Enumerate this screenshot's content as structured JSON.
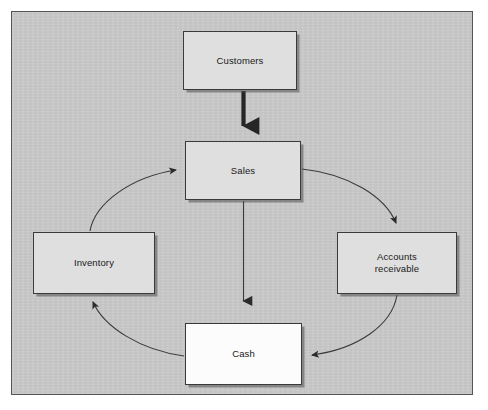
{
  "diagram": {
    "background_color": "#c9c9c9",
    "frame_border_color": "#555555",
    "node_fill_color": "#dfdfdf",
    "cash_fill_color": "#fcfcfc",
    "node_border_color": "#3a3a3a",
    "arrow_color": "#2b2b2b",
    "nodes": [
      {
        "id": "customers",
        "label": "Customers",
        "x": 183,
        "y": 31,
        "w": 114,
        "h": 59,
        "fill": "light"
      },
      {
        "id": "sales",
        "label": "Sales",
        "x": 185,
        "y": 141,
        "w": 116,
        "h": 59,
        "fill": "light"
      },
      {
        "id": "inventory",
        "label": "Inventory",
        "x": 33,
        "y": 232,
        "w": 122,
        "h": 62,
        "fill": "light"
      },
      {
        "id": "accounts-receivable",
        "label": "Accounts\nreceivable",
        "x": 337,
        "y": 232,
        "w": 120,
        "h": 62,
        "fill": "light"
      },
      {
        "id": "cash",
        "label": "Cash",
        "x": 185,
        "y": 323,
        "w": 117,
        "h": 62,
        "fill": "white"
      }
    ],
    "connectors": [
      {
        "id": "customers-to-sales",
        "from": "customers",
        "to": "sales",
        "style": "thick-straight",
        "direction": "down"
      },
      {
        "id": "sales-to-cash",
        "from": "sales",
        "to": "cash",
        "style": "thin-straight",
        "direction": "down"
      },
      {
        "id": "sales-to-accounts-receivable",
        "from": "sales",
        "to": "accounts-receivable",
        "style": "curve",
        "direction": "clockwise"
      },
      {
        "id": "accounts-receivable-to-cash",
        "from": "accounts-receivable",
        "to": "cash",
        "style": "curve",
        "direction": "clockwise"
      },
      {
        "id": "cash-to-inventory",
        "from": "cash",
        "to": "inventory",
        "style": "curve",
        "direction": "clockwise"
      },
      {
        "id": "inventory-to-sales",
        "from": "inventory",
        "to": "sales",
        "style": "curve",
        "direction": "clockwise"
      }
    ]
  }
}
